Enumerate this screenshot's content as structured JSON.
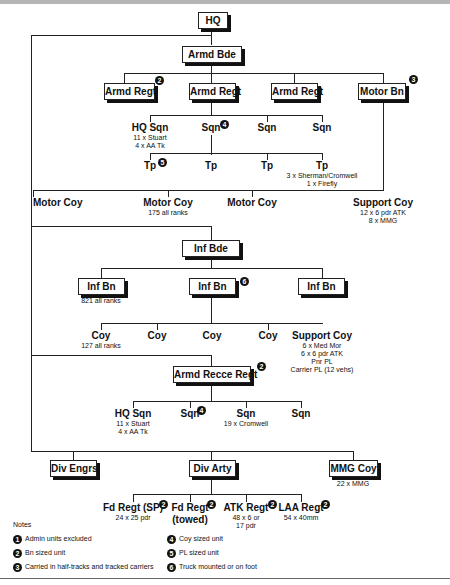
{
  "hq": "HQ",
  "armd_bde": {
    "title": "Armd Bde",
    "units": [
      "Armd Regt",
      "Armd Regt",
      "Armd Regt",
      "Motor Bn"
    ],
    "sqns": [
      {
        "name": "HQ Sqn",
        "detail": [
          "11 x Stuart",
          "4 x AA Tk"
        ]
      },
      {
        "name": "Sqn"
      },
      {
        "name": "Sqn"
      },
      {
        "name": "Sqn"
      }
    ],
    "tps": [
      {
        "name": "Tp"
      },
      {
        "name": "Tp"
      },
      {
        "name": "Tp"
      },
      {
        "name": "Tp",
        "detail": [
          "3 x Sherman/Cromwell",
          "1 x Firefly"
        ]
      }
    ],
    "motor_coys": [
      {
        "name": "Motor Coy"
      },
      {
        "name": "Motor Coy",
        "detail": [
          "175 all ranks"
        ]
      },
      {
        "name": "Motor Coy"
      },
      {
        "name": "Support Coy",
        "detail": [
          "12 x 6 pdr ATK",
          "8 x MMG"
        ]
      }
    ]
  },
  "inf_bde": {
    "title": "Inf Bde",
    "bns": [
      "Inf Bn",
      "Inf Bn",
      "Inf Bn"
    ],
    "bn_detail": "821 all ranks",
    "coys": [
      {
        "name": "Coy",
        "detail": [
          "127 all ranks"
        ]
      },
      {
        "name": "Coy"
      },
      {
        "name": "Coy"
      },
      {
        "name": "Coy"
      },
      {
        "name": "Support Coy",
        "detail": [
          "6 x Med Mor",
          "6 x 6 pdr ATK",
          "Pnr PL",
          "Carrier PL (12 vehs)"
        ]
      }
    ]
  },
  "recce": {
    "title": "Armd Recce Regt",
    "sqns": [
      {
        "name": "HQ Sqn",
        "detail": [
          "11 x Stuart",
          "4 x AA Tk"
        ]
      },
      {
        "name": "Sqn"
      },
      {
        "name": "Sqn",
        "detail": [
          "19 x Cromwell"
        ]
      },
      {
        "name": "Sqn"
      }
    ]
  },
  "div_troops": {
    "engrs": "Div Engrs",
    "arty": "Div Arty",
    "mmg": "MMG Coy",
    "mmg_detail": "22 x MMG",
    "arty_regts": [
      {
        "name": "Fd Regt (SP)",
        "detail": [
          "24 x 25 pdr"
        ]
      },
      {
        "name": "Fd Regt",
        "detail": [
          "(towed)"
        ]
      },
      {
        "name": "ATK Regt",
        "detail": [
          "48 x 6 or",
          "17 pdr"
        ]
      },
      {
        "name": "LAA Regt",
        "detail": [
          "54 x 40mm"
        ]
      }
    ]
  },
  "badges": {
    "b1": "1",
    "b2": "2",
    "b3": "3",
    "b4": "4",
    "b5": "5",
    "b6": "6"
  },
  "notes": {
    "title": "Notes",
    "items": [
      {
        "num": "1",
        "text": "Admin units excluded"
      },
      {
        "num": "2",
        "text": "Bn sized unit"
      },
      {
        "num": "3",
        "text": "Carried in half-tracks and tracked carriers"
      },
      {
        "num": "4",
        "text": "Coy sized unit"
      },
      {
        "num": "5",
        "text": "PL sized unit"
      },
      {
        "num": "6",
        "text": "Truck mounted or on foot"
      }
    ]
  }
}
